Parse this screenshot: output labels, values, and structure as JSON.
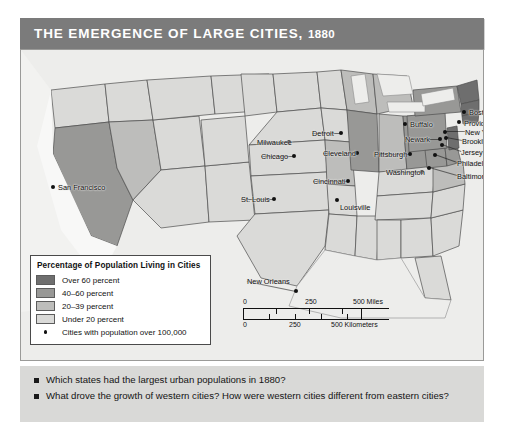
{
  "title": {
    "main": "THE EMERGENCE OF LARGE CITIES,",
    "year": "1880"
  },
  "legend": {
    "title": "Percentage of Population Living in Cities",
    "classes": [
      {
        "label": "Over 60 percent",
        "color": "#6e6e6e"
      },
      {
        "label": "40–60 percent",
        "color": "#989896"
      },
      {
        "label": "20–39 percent",
        "color": "#bdbdbb"
      },
      {
        "label": "Under 20 percent",
        "color": "#dadad8"
      }
    ],
    "city_key": "Cities with population over 100,000"
  },
  "scale": {
    "miles": {
      "ticks": [
        "0",
        "250",
        "500 Miles"
      ]
    },
    "kilometers": {
      "ticks": [
        "0",
        "250",
        "500 Kilometers"
      ]
    }
  },
  "cities": [
    {
      "name": "San Francisco",
      "x": 32,
      "y": 137,
      "lx": 37,
      "ly": 134,
      "anchor": "left"
    },
    {
      "name": "Milwaukee",
      "x": 268,
      "y": 92,
      "lx": 236,
      "ly": 89,
      "anchor": "left"
    },
    {
      "name": "Chicago",
      "x": 273,
      "y": 106,
      "lx": 240,
      "ly": 103,
      "anchor": "left"
    },
    {
      "name": "St. Louis",
      "x": 253,
      "y": 149,
      "lx": 220,
      "ly": 146,
      "anchor": "left"
    },
    {
      "name": "Detroit",
      "x": 320,
      "y": 83,
      "lx": 291,
      "ly": 80,
      "anchor": "left"
    },
    {
      "name": "Cleveland",
      "x": 336,
      "y": 103,
      "lx": 302,
      "ly": 100,
      "anchor": "left"
    },
    {
      "name": "Cincinnati",
      "x": 327,
      "y": 131,
      "lx": 292,
      "ly": 128,
      "anchor": "left"
    },
    {
      "name": "Louisville",
      "x": 316,
      "y": 150,
      "lx": 319,
      "ly": 154,
      "anchor": "left"
    },
    {
      "name": "Buffalo",
      "x": 384,
      "y": 74,
      "lx": 389,
      "ly": 71,
      "anchor": "left"
    },
    {
      "name": "Pittsburgh",
      "x": 389,
      "y": 104,
      "lx": 353,
      "ly": 101,
      "anchor": "left"
    },
    {
      "name": "Washington",
      "x": 401,
      "y": 122,
      "lx": 365,
      "ly": 119,
      "anchor": "left"
    },
    {
      "name": "Newark",
      "x": 419,
      "y": 89,
      "lx": 384,
      "ly": 86,
      "anchor": "left"
    },
    {
      "name": "Boston",
      "x": 443,
      "y": 62,
      "lx": 448,
      "ly": 59,
      "anchor": "left"
    },
    {
      "name": "Providence",
      "x": 438,
      "y": 72,
      "lx": 443,
      "ly": 70,
      "anchor": "left"
    },
    {
      "name": "New York",
      "x": 424,
      "y": 82,
      "lx": 444,
      "ly": 79,
      "anchor": "left"
    },
    {
      "name": "Brooklyn",
      "x": 425,
      "y": 88,
      "lx": 441,
      "ly": 88,
      "anchor": "left"
    },
    {
      "name": "Jersey City",
      "x": 421,
      "y": 95,
      "lx": 440,
      "ly": 99,
      "anchor": "left"
    },
    {
      "name": "Philadelphia",
      "x": 414,
      "y": 105,
      "lx": 436,
      "ly": 110,
      "anchor": "left"
    },
    {
      "name": "Baltimore",
      "x": 408,
      "y": 118,
      "lx": 436,
      "ly": 123,
      "anchor": "left"
    },
    {
      "name": "New Orleans",
      "x": 275,
      "y": 241,
      "lx": 226,
      "ly": 228,
      "anchor": "left"
    }
  ],
  "questions": [
    "Which states had the largest urban populations in 1880?",
    "What drove the growth of western cities? How were western cities different from eastern cities?"
  ],
  "colors": {
    "title_bar": "#7b7b7b",
    "map_background": "#e8e8e6",
    "question_panel": "#d9d9d7",
    "ocean": "#ededeb"
  }
}
